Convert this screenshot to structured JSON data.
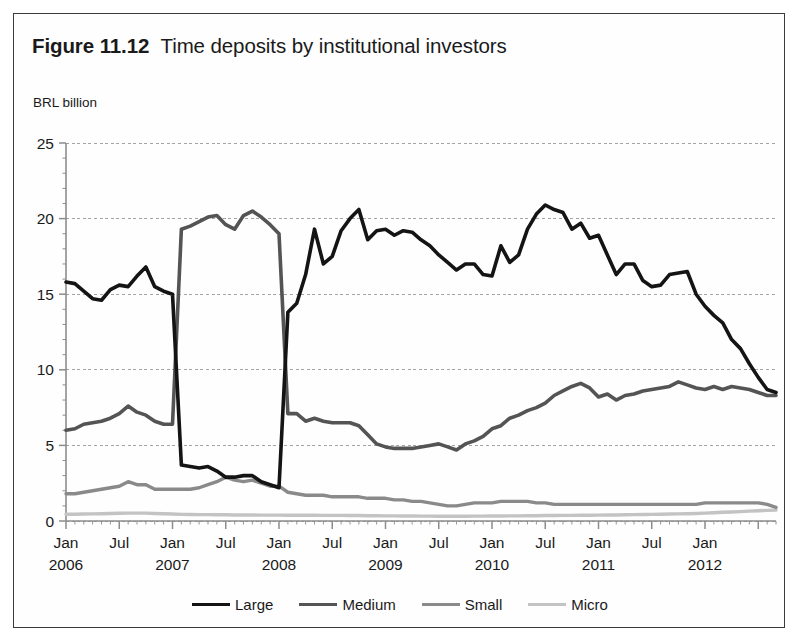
{
  "figure": {
    "label": "Figure 11.12",
    "title": "Time deposits by institutional investors",
    "unit_label": "BRL billion"
  },
  "legend": {
    "position": "bottom-center",
    "entries": [
      {
        "label": "Large",
        "color": "#141414",
        "width": 3.6
      },
      {
        "label": "Medium",
        "color": "#545454",
        "width": 3.6
      },
      {
        "label": "Small",
        "color": "#8a8a8a",
        "width": 3.4
      },
      {
        "label": "Micro",
        "color": "#c3c3c3",
        "width": 3.4
      }
    ]
  },
  "chart_data": {
    "type": "line",
    "title": "Time deposits by institutional investors",
    "subtitle": "BRL billion",
    "xlabel": "",
    "ylabel": "BRL billion",
    "ylim": [
      0,
      25
    ],
    "yticks": [
      0,
      5,
      10,
      15,
      20,
      25
    ],
    "grid": true,
    "grid_style": "dotted-horizontal",
    "xlim": [
      "2006-01",
      "2012-09"
    ],
    "xtick_labels": [
      {
        "month": "Jan",
        "year": "2006"
      },
      {
        "month": "Jul",
        "year": ""
      },
      {
        "month": "Jan",
        "year": "2007"
      },
      {
        "month": "Jul",
        "year": ""
      },
      {
        "month": "Jan",
        "year": "2008"
      },
      {
        "month": "Jul",
        "year": ""
      },
      {
        "month": "Jan",
        "year": "2009"
      },
      {
        "month": "Jul",
        "year": ""
      },
      {
        "month": "Jan",
        "year": "2010"
      },
      {
        "month": "Jul",
        "year": ""
      },
      {
        "month": "Jan",
        "year": "2011"
      },
      {
        "month": "Jul",
        "year": ""
      },
      {
        "month": "Jan",
        "year": "2012"
      }
    ],
    "x": [
      "2006-01",
      "2006-02",
      "2006-03",
      "2006-04",
      "2006-05",
      "2006-06",
      "2006-07",
      "2006-08",
      "2006-09",
      "2006-10",
      "2006-11",
      "2006-12",
      "2007-01",
      "2007-02",
      "2007-03",
      "2007-04",
      "2007-05",
      "2007-06",
      "2007-07",
      "2007-08",
      "2007-09",
      "2007-10",
      "2007-11",
      "2007-12",
      "2008-01",
      "2008-02",
      "2008-03",
      "2008-04",
      "2008-05",
      "2008-06",
      "2008-07",
      "2008-08",
      "2008-09",
      "2008-10",
      "2008-11",
      "2008-12",
      "2009-01",
      "2009-02",
      "2009-03",
      "2009-04",
      "2009-05",
      "2009-06",
      "2009-07",
      "2009-08",
      "2009-09",
      "2009-10",
      "2009-11",
      "2009-12",
      "2010-01",
      "2010-02",
      "2010-03",
      "2010-04",
      "2010-05",
      "2010-06",
      "2010-07",
      "2010-08",
      "2010-09",
      "2010-10",
      "2010-11",
      "2010-12",
      "2011-01",
      "2011-02",
      "2011-03",
      "2011-04",
      "2011-05",
      "2011-06",
      "2011-07",
      "2011-08",
      "2011-09",
      "2011-10",
      "2011-11",
      "2011-12",
      "2012-01",
      "2012-02",
      "2012-03",
      "2012-04",
      "2012-05",
      "2012-06",
      "2012-07",
      "2012-08",
      "2012-09"
    ],
    "series": [
      {
        "name": "Large",
        "color": "#141414",
        "values": [
          15.8,
          15.7,
          15.2,
          14.7,
          14.6,
          15.3,
          15.6,
          15.5,
          16.2,
          16.8,
          15.5,
          15.2,
          15.0,
          3.7,
          3.6,
          3.5,
          3.6,
          3.3,
          2.9,
          2.9,
          3.0,
          3.0,
          2.6,
          2.4,
          2.2,
          13.8,
          14.4,
          16.3,
          19.3,
          17.0,
          17.5,
          19.2,
          20.0,
          20.6,
          18.6,
          19.2,
          19.3,
          18.9,
          19.2,
          19.1,
          18.6,
          18.2,
          17.6,
          17.1,
          16.6,
          17.0,
          17.0,
          16.3,
          16.2,
          18.2,
          17.1,
          17.6,
          19.3,
          20.3,
          20.9,
          20.6,
          20.4,
          19.3,
          19.7,
          18.7,
          18.9,
          17.6,
          16.3,
          17.0,
          17.0,
          15.9,
          15.5,
          15.6,
          16.3,
          16.4,
          16.5,
          15.0,
          14.2,
          13.6,
          13.1,
          12.0,
          11.4,
          10.4,
          9.5,
          8.7,
          8.5
        ]
      },
      {
        "name": "Medium",
        "color": "#545454",
        "values": [
          6.0,
          6.1,
          6.4,
          6.5,
          6.6,
          6.8,
          7.1,
          7.6,
          7.2,
          7.0,
          6.6,
          6.4,
          6.4,
          19.3,
          19.5,
          19.8,
          20.1,
          20.2,
          19.6,
          19.3,
          20.2,
          20.5,
          20.1,
          19.6,
          19.0,
          7.1,
          7.1,
          6.6,
          6.8,
          6.6,
          6.5,
          6.5,
          6.5,
          6.3,
          5.7,
          5.1,
          4.9,
          4.8,
          4.8,
          4.8,
          4.9,
          5.0,
          5.1,
          4.9,
          4.7,
          5.1,
          5.3,
          5.6,
          6.1,
          6.3,
          6.8,
          7.0,
          7.3,
          7.5,
          7.8,
          8.3,
          8.6,
          8.9,
          9.1,
          8.8,
          8.2,
          8.4,
          8.0,
          8.3,
          8.4,
          8.6,
          8.7,
          8.8,
          8.9,
          9.2,
          9.0,
          8.8,
          8.7,
          8.9,
          8.7,
          8.9,
          8.8,
          8.7,
          8.5,
          8.3,
          8.3
        ]
      },
      {
        "name": "Small",
        "color": "#8a8a8a",
        "values": [
          1.8,
          1.8,
          1.9,
          2.0,
          2.1,
          2.2,
          2.3,
          2.6,
          2.4,
          2.4,
          2.1,
          2.1,
          2.1,
          2.1,
          2.1,
          2.2,
          2.4,
          2.6,
          2.9,
          2.7,
          2.6,
          2.7,
          2.5,
          2.3,
          2.3,
          1.9,
          1.8,
          1.7,
          1.7,
          1.7,
          1.6,
          1.6,
          1.6,
          1.6,
          1.5,
          1.5,
          1.5,
          1.4,
          1.4,
          1.3,
          1.3,
          1.2,
          1.1,
          1.0,
          1.0,
          1.1,
          1.2,
          1.2,
          1.2,
          1.3,
          1.3,
          1.3,
          1.3,
          1.2,
          1.2,
          1.1,
          1.1,
          1.1,
          1.1,
          1.1,
          1.1,
          1.1,
          1.1,
          1.1,
          1.1,
          1.1,
          1.1,
          1.1,
          1.1,
          1.1,
          1.1,
          1.1,
          1.2,
          1.2,
          1.2,
          1.2,
          1.2,
          1.2,
          1.2,
          1.1,
          0.9
        ]
      },
      {
        "name": "Micro",
        "color": "#c3c3c3",
        "values": [
          0.45,
          0.45,
          0.46,
          0.47,
          0.48,
          0.5,
          0.51,
          0.52,
          0.52,
          0.52,
          0.5,
          0.48,
          0.46,
          0.44,
          0.43,
          0.42,
          0.42,
          0.41,
          0.41,
          0.4,
          0.4,
          0.4,
          0.39,
          0.39,
          0.39,
          0.38,
          0.38,
          0.38,
          0.38,
          0.37,
          0.37,
          0.37,
          0.36,
          0.36,
          0.35,
          0.35,
          0.34,
          0.34,
          0.33,
          0.33,
          0.32,
          0.32,
          0.31,
          0.31,
          0.31,
          0.31,
          0.32,
          0.32,
          0.33,
          0.33,
          0.34,
          0.34,
          0.35,
          0.35,
          0.36,
          0.36,
          0.37,
          0.37,
          0.38,
          0.38,
          0.39,
          0.4,
          0.4,
          0.41,
          0.42,
          0.43,
          0.44,
          0.45,
          0.46,
          0.47,
          0.48,
          0.5,
          0.52,
          0.55,
          0.58,
          0.6,
          0.62,
          0.65,
          0.68,
          0.7,
          0.72
        ]
      }
    ]
  }
}
